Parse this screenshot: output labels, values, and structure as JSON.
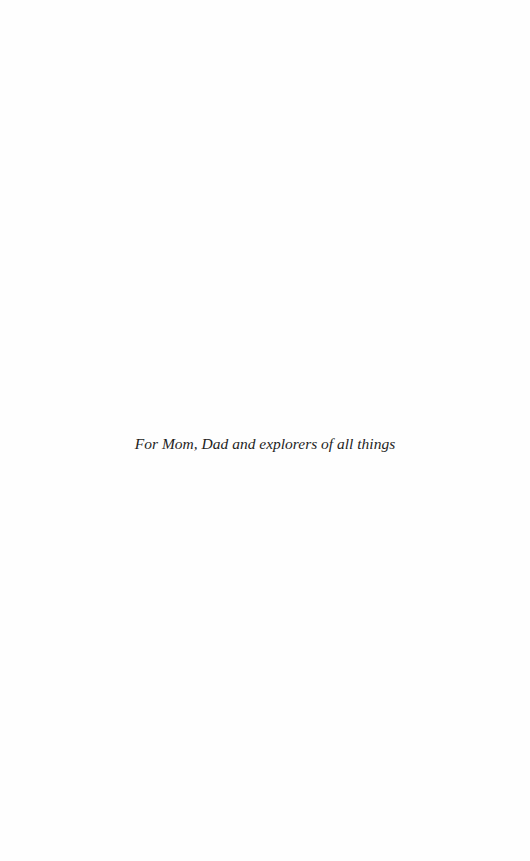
{
  "page": {
    "background_color": "#fefefe",
    "text_color": "#1e1e1e"
  },
  "dedication": {
    "text": "For Mom, Dad and explorers of all things"
  }
}
